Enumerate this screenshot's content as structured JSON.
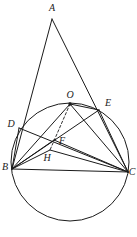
{
  "figure": {
    "kind": "euclidean-geometry-diagram",
    "width": 137,
    "height": 237,
    "stroke_color": "#1a1a1a",
    "background_color": "#ffffff",
    "caption": "",
    "points": [
      {
        "id": "A",
        "label": "A",
        "x": 52,
        "y": 19,
        "label_x": 52,
        "label_y": 8,
        "on_circle": false,
        "marked_dot": false
      },
      {
        "id": "O",
        "label": "O",
        "x": 70,
        "y": 104,
        "label_x": 70,
        "label_y": 95,
        "on_circle": false,
        "marked_dot": true
      },
      {
        "id": "E",
        "label": "E",
        "x": 99,
        "y": 110,
        "label_x": 108,
        "label_y": 103,
        "on_circle": true,
        "marked_dot": false
      },
      {
        "id": "D",
        "label": "D",
        "x": 19,
        "y": 128,
        "label_x": 11,
        "label_y": 124,
        "on_circle": true,
        "marked_dot": false
      },
      {
        "id": "F",
        "label": "F",
        "x": 54,
        "y": 140,
        "label_x": 62,
        "label_y": 141,
        "on_circle": false,
        "marked_dot": false
      },
      {
        "id": "H",
        "label": "H",
        "x": 50,
        "y": 150,
        "label_x": 47,
        "label_y": 158,
        "on_circle": false,
        "marked_dot": false
      },
      {
        "id": "B",
        "label": "B",
        "x": 12,
        "y": 169,
        "label_x": 5,
        "label_y": 167,
        "on_circle": true,
        "marked_dot": false
      },
      {
        "id": "C",
        "label": "C",
        "x": 128,
        "y": 172,
        "label_x": 132,
        "label_y": 172,
        "on_circle": true,
        "marked_dot": false
      }
    ],
    "circle": {
      "cx": 70,
      "cy": 162,
      "r": 59,
      "label": "circumcircle"
    },
    "segments": [
      {
        "from": "A",
        "to": "B",
        "style": "solid",
        "name": "segment-AB"
      },
      {
        "from": "A",
        "to": "C",
        "style": "solid",
        "name": "segment-AC"
      },
      {
        "from": "B",
        "to": "C",
        "style": "solid",
        "name": "segment-BC"
      },
      {
        "from": "B",
        "to": "D",
        "style": "solid",
        "name": "segment-BD"
      },
      {
        "from": "B",
        "to": "E",
        "style": "solid",
        "name": "segment-BE"
      },
      {
        "from": "B",
        "to": "O",
        "style": "solid",
        "name": "segment-BO"
      },
      {
        "from": "B",
        "to": "F",
        "style": "solid",
        "name": "segment-BF"
      },
      {
        "from": "B",
        "to": "H",
        "style": "solid",
        "name": "segment-BH"
      },
      {
        "from": "C",
        "to": "D",
        "style": "solid",
        "name": "segment-CD"
      },
      {
        "from": "C",
        "to": "E",
        "style": "solid",
        "name": "segment-CE"
      },
      {
        "from": "C",
        "to": "O",
        "style": "solid",
        "name": "segment-CO"
      },
      {
        "from": "C",
        "to": "F",
        "style": "solid",
        "name": "segment-CF"
      },
      {
        "from": "C",
        "to": "H",
        "style": "solid",
        "name": "segment-CH"
      },
      {
        "from": "O",
        "to": "E",
        "style": "solid",
        "name": "segment-OE"
      },
      {
        "from": "O",
        "to": "H",
        "style": "dashed",
        "name": "segment-OH-dashed"
      }
    ]
  }
}
